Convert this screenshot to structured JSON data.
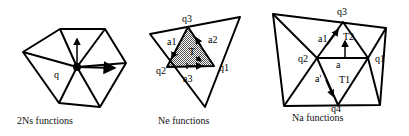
{
  "diagram": {
    "panels": [
      {
        "id": "ns",
        "caption": "2Ns functions",
        "labels": {
          "node": "q"
        }
      },
      {
        "id": "ne",
        "caption": "Ne functions",
        "labels": {
          "q1": "q1",
          "q2": "q2",
          "q3": "q3",
          "a1": "a1",
          "a2": "a2",
          "a3": "a3",
          "T": "T"
        }
      },
      {
        "id": "na",
        "caption": "Na functions",
        "labels": {
          "q1": "q1",
          "q2": "q2",
          "q3": "q3",
          "q4": "q4",
          "a1": "a1",
          "a": "a",
          "a_prime": "a'",
          "T1": "T1",
          "T2": "T2"
        }
      }
    ],
    "colors": {
      "stroke": "#000000",
      "shade": "#a8a8a8",
      "background": "#ffffff"
    }
  }
}
